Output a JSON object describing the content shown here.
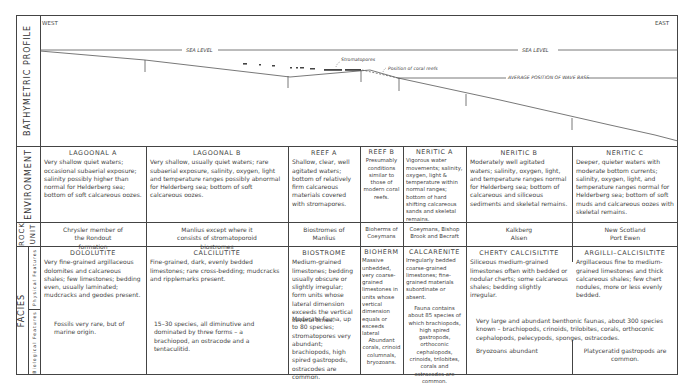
{
  "row_labels": {
    "bathymetric_profile": "BATHYMETRIC PROFILE",
    "environment": "ENVIRONMENT",
    "rock_unit_1": "ROCK",
    "rock_unit_2": "UNIT",
    "facies": "FACIES",
    "physical_features": "Physical Features",
    "biological_features": "Biological Features"
  },
  "profile": {
    "west": "WEST",
    "east": "EAST",
    "sea_level_1": "SEA LEVEL",
    "sea_level_2": "SEA LEVEL",
    "stromatopores": "Stromatopores",
    "coral_reefs": "Position of coral reefs",
    "wave_base": "AVERAGE POSITION OF WAVE BASE"
  },
  "columns": [
    {
      "environment_title": "LAGOONAL A",
      "environment_text": "Very shallow quiet waters; occasional subaerial exposure; salinity possibly higher than normal for Helderberg sea; bottom of soft calcareous oozes.",
      "rock_unit": "Chrysler member of the Rondout formation",
      "facies_title": "DOLOLUTITE",
      "physical": "Very fine-grained argillaceous dolomites and calcareous shales; few limestones; bedding even, usually laminated; mudcracks and geodes present.",
      "biological": "Fossils very rare, but of marine origin."
    },
    {
      "environment_title": "LAGOONAL B",
      "environment_text": "Very shallow, usually quiet waters; rare subaerial exposure, salinity, oxygen, light and temperature ranges possibly abnormal for Helderberg sea; bottom of soft calcareous oozes.",
      "rock_unit": "Manlius except where it consists of stromatoporoid biostromes",
      "facies_title": "CALCILUTITE",
      "physical": "Fine-grained, dark, evenly bedded limestones; rare cross-bedding; mudcracks and ripplemarks present.",
      "biological": "15–30 species, all diminutive and dominated by three forms – a brachiopod, an ostracode and a tentaculitid."
    },
    {
      "environment_title": "REEF A",
      "environment_text": "Shallow, clear, well agitated waters; bottom of relatively firm calcareous materials covered with stromapores.",
      "rock_unit": "Biostromes of Manlius",
      "facies_title": "BIOSTROME",
      "physical": "Medium-grained limestones; bedding usually obscure or slightly irregular; form units whose lateral dimension exceeds the vertical several times.",
      "biological": "Moderate fauna, up to 80 species; stromatopores very abundant; brachiopods, high spired gastropods, ostracodes are common."
    },
    {
      "environment_title": "REEF B",
      "environment_text": "Presumably conditions similar to those of modern coral reefs.",
      "rock_unit": "Bioherms of Coeymans",
      "facies_title": "BIOHERM",
      "physical": "Massive unbedded, very coarse-grained limestones in units whose vertical dimension equals or exceeds lateral",
      "biological": "Abundant corals, crinoid columnals, bryozoans."
    },
    {
      "environment_title": "NERITIC A",
      "environment_text": "Vigorous water movements; salinity, oxygen, light & temperature within normal ranges; bottom of hard shifting calcareous sands and skeletal remains.",
      "rock_unit": "Coeymans, Bishop Brook and Becraft",
      "facies_title": "CALCARENITE",
      "physical": "Irregularly bedded coarse-grained limestones; fine-grained materials subordinate or absent.",
      "biological": "Fauna contains about 85 species of which brachiopods, high spired gastropods, orthoconic cephalopods, crinoids, trilobites, corals and ostracodes are common."
    },
    {
      "environment_title": "NERITIC B",
      "environment_text": "Moderately well agitated waters; salinity, oxygen, light, and temperature ranges normal for Helderberg sea; bottom of calcareous and siliceous sediments and skeletal remains.",
      "rock_unit_1": "Kalkberg",
      "rock_unit_2": "Alsen",
      "facies_title": "CHERTY CALCISILTITE",
      "physical": "Siliceous medium-grained limestones often with bedded or nodular cherts; some calcareous shales; bedding slightly irregular.",
      "biological": "Bryozoans abundant"
    },
    {
      "environment_title": "NERITIC C",
      "environment_text": "Deeper, quieter waters with moderate bottom currents; salinity, oxygen, light, and temperature ranges normal for Helderberg sea; bottom of soft muds and calcareous oozes with skeletal remains.",
      "rock_unit_1": "New Scotland",
      "rock_unit_2": "Port Ewen",
      "facies_title": "ARGILLI–CALCISILTITE",
      "physical": "Argillaceous fine to medium-grained limestones and thick calcareous shales; few chert nodules, more or less evenly bedded.",
      "biological": "Platyceratid gastropods are common."
    }
  ],
  "shared_biological_neritic": "Very large and abundant benthonic faunas, about 300 species known – brachiopods, crinoids, trilobites, corals, orthoconic cephalopods, pelecypods, sponges, ostracodes."
}
